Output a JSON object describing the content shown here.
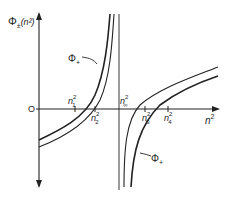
{
  "diagram": {
    "y_axis_label": "Φ±(n²)",
    "y_axis_label_base": "Φ",
    "y_axis_label_sub": "±",
    "y_axis_label_arg": "(n²)",
    "x_axis_label": "n²",
    "origin_label": "O",
    "curve_labels": {
      "upper_left": "Φ+",
      "lower_right": "Φ+"
    },
    "root_labels": [
      "n₁²",
      "n₂²",
      "n∞²",
      "n₃²",
      "n₄²"
    ],
    "roots": [
      {
        "name": "n1",
        "sup": "2"
      },
      {
        "name": "n2",
        "sup": "2"
      },
      {
        "name": "n∞",
        "sup": "2",
        "note": "vertical asymptote"
      },
      {
        "name": "n3",
        "sup": "2"
      },
      {
        "name": "n4",
        "sup": "2"
      }
    ],
    "colors": {
      "stroke": "#222222",
      "background": "#ffffff"
    }
  }
}
